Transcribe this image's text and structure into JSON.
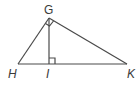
{
  "diagram": {
    "line_color": "#4a4a4a",
    "labels": {
      "G": "G",
      "H": "H",
      "I": "I",
      "K": "K"
    },
    "points": {
      "G": [
        49,
        18
      ],
      "H": [
        18,
        64
      ],
      "I": [
        49,
        64
      ],
      "K": [
        127,
        64
      ]
    },
    "right_angles": [
      "G",
      "I"
    ]
  }
}
